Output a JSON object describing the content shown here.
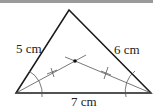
{
  "diagram": {
    "type": "triangle-incenter-construction",
    "side_labels": {
      "left": "5 cm",
      "right": "6 cm",
      "bottom": "7 cm"
    },
    "vertices": {
      "A_bottom_left": [
        16,
        93
      ],
      "B_top": [
        69,
        10
      ],
      "C_bottom_right": [
        151,
        93
      ]
    },
    "incenter": [
      75,
      61
    ],
    "colors": {
      "sides": "#1a1a1a",
      "construction": "#555555",
      "topbar": "#9a9a9a"
    }
  }
}
